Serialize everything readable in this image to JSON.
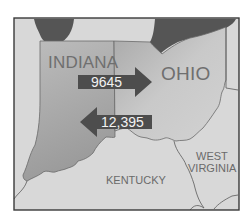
{
  "map": {
    "states": [
      {
        "name": "INDIANA",
        "label": "INDIANA"
      },
      {
        "name": "OHIO",
        "label": "OHIO"
      },
      {
        "name": "KENTUCKY",
        "label": "KENTUCKY"
      },
      {
        "name": "WEST VIRGINIA",
        "label_line1": "WEST",
        "label_line2": "VIRGINIA"
      }
    ],
    "flows": [
      {
        "from": "INDIANA",
        "to": "OHIO",
        "direction": "right",
        "value": "9645"
      },
      {
        "from": "OHIO",
        "to": "INDIANA",
        "direction": "left",
        "value": "12,395"
      }
    ],
    "colors": {
      "frame": "#3a3a3a",
      "background_land": "#d6d6d6",
      "indiana_fill": "#a9a9a9",
      "ohio_fill": "#c4c4c4",
      "lake": "#555555",
      "arrow": "#4d4d4d",
      "border_line": "#5a5a5a"
    }
  }
}
